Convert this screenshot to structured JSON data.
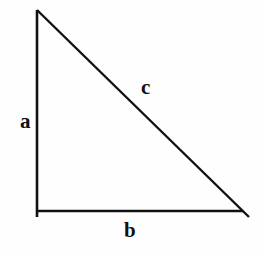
{
  "figure": {
    "name": "right-triangle-diagram",
    "background_color": "#fefefe",
    "stroke_color": "#111111",
    "stroke_width": 2.6,
    "width": 263,
    "height": 253
  },
  "labels": {
    "leg_vertical": "a",
    "leg_horizontal": "b",
    "hypotenuse": "c"
  },
  "geometry": {
    "apex": {
      "x": 37,
      "y": 10
    },
    "right_angle_corner": {
      "x": 37,
      "y": 211
    },
    "base_end": {
      "x": 243,
      "y": 211
    },
    "vertical_overshoot_end": {
      "x": 37,
      "y": 217
    },
    "hypotenuse_overshoot_end": {
      "x": 249,
      "y": 217
    },
    "segments": {
      "vertical_leg": "M 37 10 L 37 217",
      "horizontal_leg": "M 36 211 L 243 211",
      "hypotenuse": "M 37 10 L 249 217"
    }
  }
}
